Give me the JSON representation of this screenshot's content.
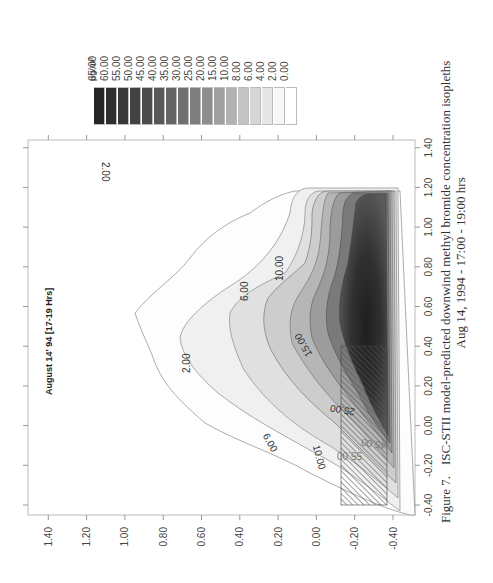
{
  "chart_data": {
    "type": "contour",
    "title": "ISC-STII model-predicted downwind methyl bromide concentration isopleths",
    "subtitle": "Aug 14, 1994 - 17:00 - 19:00 hrs",
    "figure_label": "Figure 7.",
    "annotation": "August 14' 94 [17-19 Hrs]",
    "xlabel": "",
    "ylabel": "",
    "xlim": [
      -0.5,
      1.5
    ],
    "ylim": [
      -0.45,
      1.5
    ],
    "x_ticks": [
      "-0.40",
      "-0.20",
      "0.00",
      "0.20",
      "0.40",
      "0.60",
      "0.80",
      "1.00",
      "1.20",
      "1.40"
    ],
    "y_ticks": [
      "-0.40",
      "-0.20",
      "0.00",
      "0.20",
      "0.40",
      "0.60",
      "0.80",
      "1.00",
      "1.20",
      "1.40"
    ],
    "legend": {
      "unit": "µg/m³",
      "levels": [
        "65.00",
        "60.00",
        "55.00",
        "50.00",
        "45.00",
        "40.00",
        "35.00",
        "30.00",
        "25.00",
        "20.00",
        "15.00",
        "10.00",
        "8.00",
        "6.00",
        "4.00",
        "2.00",
        "0.00"
      ],
      "colors": [
        "#262626",
        "#2e2e2e",
        "#383838",
        "#424242",
        "#4c4c4c",
        "#585858",
        "#646464",
        "#707070",
        "#7e7e7e",
        "#8e8e8e",
        "#a0a0a0",
        "#b2b2b2",
        "#c4c4c4",
        "#d6d6d6",
        "#e6e6e6",
        "#f6f6f6",
        "#ffffff"
      ]
    },
    "contour_labels": [
      "2.00",
      "2.00",
      "6.00",
      "6.00",
      "10.00",
      "10.00",
      "15.00",
      "25.00",
      "45.00",
      "55.00"
    ],
    "source_region": {
      "x": [
        -0.4,
        0.0
      ],
      "y": [
        -0.4,
        0.0
      ],
      "pattern": "hatched"
    }
  }
}
